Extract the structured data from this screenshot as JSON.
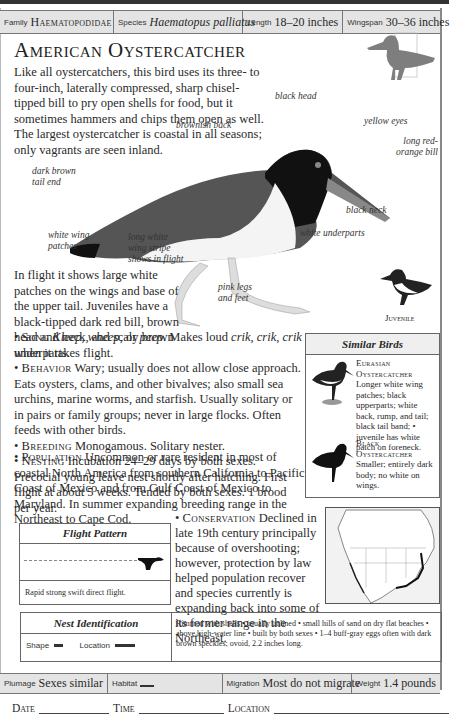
{
  "header": {
    "family_label": "Family",
    "family_value": "Haematopodidae",
    "species_label": "Species",
    "species_value": "Haematopus palliatus",
    "length_label": "Length",
    "length_value": "18–20 inches",
    "wingspan_label": "Wingspan",
    "wingspan_value": "30–36 inches"
  },
  "title": "American Oystercatcher",
  "intro": "Like all oystercatchers, this bird uses its three- to four-inch, laterally compressed, sharp chisel-tipped bill to pry open shells for food, but it sometimes hammers and chips them open as well. The largest oystercatcher is coastal in all seasons; only vagrants are seen inland.",
  "callouts": {
    "black_head": "black head",
    "yellow_eyes": "yellow eyes",
    "bill": "long red-orange bill",
    "brownish_back": "brownish back",
    "tail_end": "dark brown tail end",
    "black_neck": "black neck",
    "white_wing_patches": "white wing patches",
    "wing_stripe": "long white wing stripe shows in flight",
    "white_underparts": "white underparts",
    "legs": "pink legs and feet"
  },
  "juvenile_label": "Juvenile",
  "flight_text": "In flight it shows large white patches on the wings and base of the upper tail. Juveniles have a black-tipped dark red bill, brown head and neck, and scaly brown underparts.",
  "sections": {
    "song_head": "Song",
    "song_pre": "Kleep, wheep,",
    "song_mid": " or ",
    "song_peep": "peep",
    "song_text": ". Makes loud ",
    "song_crik": "crik, crik, crik",
    "song_end": " when it takes flight.",
    "behavior_head": "Behavior",
    "behavior_text": " Wary; usually does not allow close approach. Eats oysters, clams, and other bivalves; also small sea urchins, marine worms, and starfish. Usually solitary or in pairs or family groups; never in large flocks. Often feeds with other birds.",
    "breeding_head": "Breeding",
    "breeding_text": " Monogamous. Solitary nester.",
    "nesting_head": "Nesting",
    "nesting_text": " Incubation 24–29 days by both sexes. Precocial young leave nest shortly after hatching. First flight at about 5 weeks. Tended by both sexes. 1 brood per year.",
    "population_head": "Population",
    "population_text": " Uncommon or rare resident in most of coastal North America from southern California to Pacific Coast of Mexico and from Gulf Coast of Mexico to Maryland. In summer expanding breeding range in the Northeast to Cape Cod.",
    "conservation_head": "Conservation",
    "conservation_text": " Declined in late 19th century principally because of overshooting; however, protection by law helped population recover and species currently is expanding back into some of its former range in the Northeast."
  },
  "similar_birds": {
    "title": "Similar Birds",
    "items": [
      {
        "name": "Eurasian Oystercatcher",
        "desc": "Longer white wing patches; black upperparts; white back, rump, and tail; black tail band; • juvenile has white patch on foreneck."
      },
      {
        "name": "Black Oystercatcher",
        "desc": "Smaller; entirely dark body; no white on wings."
      }
    ]
  },
  "flight_pattern": {
    "title": "Flight Pattern",
    "caption": "Rapid strong swift direct flight."
  },
  "nest": {
    "title": "Nest Identification",
    "shape_label": "Shape",
    "location_label": "Location",
    "description": "Rimmed with shells • usually unlined • small hills of sand on dry flat beaches • above high-water line • built by both sexes • 1–4 buff-gray eggs often with dark brown speckles; ovoid, 2.2 inches long."
  },
  "footer": {
    "plumage_label": "Plumage",
    "plumage_value": "Sexes similar",
    "habitat_label": "Habitat",
    "migration_label": "Migration",
    "migration_value": "Most do not migrate",
    "weight_label": "Weight",
    "weight_value": "1.4 pounds"
  },
  "log": {
    "date": "Date",
    "time": "Time",
    "location": "Location"
  }
}
